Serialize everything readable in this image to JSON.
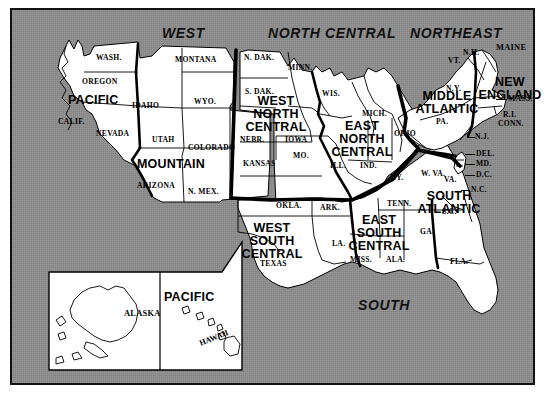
{
  "figure": {
    "caption": "",
    "frame": {
      "background_color": "#8e8e8e",
      "land_color": "#ffffff",
      "line_color": "#000000"
    }
  },
  "regions": [
    {
      "id": "west",
      "label": "WEST"
    },
    {
      "id": "north-central",
      "label": "NORTH CENTRAL"
    },
    {
      "id": "northeast",
      "label": "NORTHEAST"
    },
    {
      "id": "south",
      "label": "SOUTH"
    }
  ],
  "divisions": [
    {
      "id": "pacific",
      "label": "PACIFIC"
    },
    {
      "id": "mountain",
      "label": "MOUNTAIN"
    },
    {
      "id": "west-north-central",
      "line1": "WEST",
      "line2": "NORTH",
      "line3": "CENTRAL"
    },
    {
      "id": "east-north-central",
      "line1": "EAST",
      "line2": "NORTH",
      "line3": "CENTRAL"
    },
    {
      "id": "west-south-central",
      "line1": "WEST",
      "line2": "SOUTH",
      "line3": "CENTRAL"
    },
    {
      "id": "east-south-central",
      "line1": "EAST",
      "line2": "SOUTH",
      "line3": "CENTRAL"
    },
    {
      "id": "middle-atlantic",
      "line1": "MIDDLE",
      "line2": "ATLANTIC"
    },
    {
      "id": "new-england",
      "line1": "NEW",
      "line2": "ENGLAND"
    },
    {
      "id": "south-atlantic",
      "line1": "SOUTH",
      "line2": "ATLANTIC"
    },
    {
      "id": "pacific-inset",
      "label": "PACIFIC"
    }
  ],
  "states": [
    {
      "id": "wash",
      "label": "WASH."
    },
    {
      "id": "oregon",
      "label": "OREGON"
    },
    {
      "id": "calif",
      "label": "CALIF."
    },
    {
      "id": "nevada",
      "label": "NEVADA"
    },
    {
      "id": "idaho",
      "label": "IDAHO"
    },
    {
      "id": "montana",
      "label": "MONTANA"
    },
    {
      "id": "wyo",
      "label": "WYO."
    },
    {
      "id": "utah",
      "label": "UTAH"
    },
    {
      "id": "colorado",
      "label": "COLORADO"
    },
    {
      "id": "arizona",
      "label": "ARIZONA"
    },
    {
      "id": "nmex",
      "label": "N. MEX."
    },
    {
      "id": "ndak",
      "label": "N. DAK."
    },
    {
      "id": "sdak",
      "label": "S. DAK."
    },
    {
      "id": "nebr",
      "label": "NEBR."
    },
    {
      "id": "kansas",
      "label": "KANSAS"
    },
    {
      "id": "minn",
      "label": "MINN."
    },
    {
      "id": "iowa",
      "label": "IOWA"
    },
    {
      "id": "mo",
      "label": "MO."
    },
    {
      "id": "wis",
      "label": "WIS."
    },
    {
      "id": "mich",
      "label": "MICH."
    },
    {
      "id": "ill",
      "label": "ILL."
    },
    {
      "id": "ind",
      "label": "IND."
    },
    {
      "id": "ohio",
      "label": "OHIO"
    },
    {
      "id": "okla",
      "label": "OKLA."
    },
    {
      "id": "texas",
      "label": "TEXAS"
    },
    {
      "id": "ark",
      "label": "ARK."
    },
    {
      "id": "la",
      "label": "LA."
    },
    {
      "id": "miss",
      "label": "MISS."
    },
    {
      "id": "ala",
      "label": "ALA."
    },
    {
      "id": "tenn",
      "label": "TENN."
    },
    {
      "id": "ky",
      "label": "KY."
    },
    {
      "id": "wva",
      "label": "W. VA."
    },
    {
      "id": "va",
      "label": "VA."
    },
    {
      "id": "nc",
      "label": "N.C."
    },
    {
      "id": "sc",
      "label": "S.C."
    },
    {
      "id": "ga",
      "label": "GA."
    },
    {
      "id": "fla",
      "label": "FLA."
    },
    {
      "id": "pa",
      "label": "PA."
    },
    {
      "id": "ny",
      "label": "N.Y."
    },
    {
      "id": "nj",
      "label": "N.J."
    },
    {
      "id": "del",
      "label": "DEL."
    },
    {
      "id": "md",
      "label": "MD."
    },
    {
      "id": "dc",
      "label": "D.C."
    },
    {
      "id": "vt",
      "label": "VT."
    },
    {
      "id": "nh",
      "label": "N.H."
    },
    {
      "id": "maine",
      "label": "MAINE"
    },
    {
      "id": "mass",
      "label": "MASS."
    },
    {
      "id": "ri",
      "label": "R.I."
    },
    {
      "id": "conn",
      "label": "CONN."
    },
    {
      "id": "alaska",
      "label": "ALASKA"
    },
    {
      "id": "hawaii",
      "label": "HAWAII"
    }
  ]
}
